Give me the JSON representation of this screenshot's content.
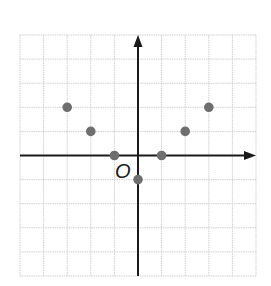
{
  "chart_data": {
    "type": "scatter",
    "title": "",
    "xlabel": "",
    "ylabel": "",
    "origin_label": "O",
    "xlim": [
      -5,
      5
    ],
    "ylim": [
      -5,
      5
    ],
    "grid": true,
    "axis_arrows": [
      "positive-x",
      "positive-y"
    ],
    "tick_labels": false,
    "series": [
      {
        "name": "points",
        "color": "#6e6e6e",
        "points": [
          {
            "x": -3,
            "y": 2
          },
          {
            "x": -2,
            "y": 1
          },
          {
            "x": -1,
            "y": 0
          },
          {
            "x": 0,
            "y": -1
          },
          {
            "x": 1,
            "y": 0
          },
          {
            "x": 2,
            "y": 1
          },
          {
            "x": 3,
            "y": 2
          }
        ]
      }
    ]
  },
  "colors": {
    "grid": "#cfcfcf",
    "axis": "#1a1a1a",
    "point": "#6e6e6e"
  }
}
